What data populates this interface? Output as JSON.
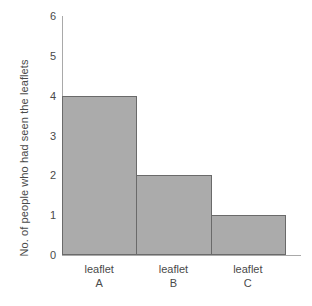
{
  "chart_data": {
    "type": "bar",
    "title": "",
    "xlabel": "",
    "ylabel": "No. of people who had seen the leaflets",
    "categories": [
      "leaflet A",
      "leaflet B",
      "leaflet C"
    ],
    "category_lines": [
      {
        "name": "leaflet",
        "code": "A"
      },
      {
        "name": "leaflet",
        "code": "B"
      },
      {
        "name": "leaflet",
        "code": "C"
      }
    ],
    "values": [
      4,
      2,
      1
    ],
    "ylim": [
      0,
      6
    ],
    "y_ticks": [
      0,
      1,
      2,
      3,
      4,
      5,
      6
    ],
    "y_tick_labels": [
      "0",
      "1",
      "2",
      "3",
      "4",
      "5",
      "6"
    ],
    "grid": false,
    "legend": false,
    "legend_position": "none",
    "bar_gap": 0,
    "colors": {
      "bar_fill": "#ababab",
      "bar_border": "#6a6a6a",
      "axis": "#a9a9a9",
      "text": "#4a4a4a",
      "background": "#ffffff"
    }
  }
}
